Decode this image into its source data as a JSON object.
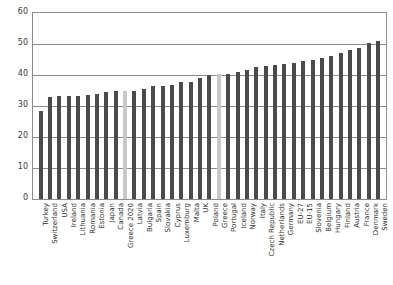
{
  "chart_data": {
    "type": "bar",
    "title": "",
    "subtitle": "",
    "xlabel": "",
    "ylabel": "",
    "ylim": [
      0,
      60
    ],
    "grid": true,
    "legend": "none",
    "y_ticks": [
      0,
      10,
      20,
      30,
      40,
      50,
      60
    ],
    "categories": [
      "Turkey",
      "Switzerland",
      "USA",
      "Ireland",
      "Lithuania",
      "Romania",
      "Estonia",
      "Japan",
      "Canada",
      "Greece 2020",
      "Latvia",
      "Bulgaria",
      "Spain",
      "Slovakia",
      "Cyprus",
      "Luxemburg",
      "Malta",
      "UK",
      "Poland",
      "Greece",
      "Portugal",
      "Iceland",
      "Norway",
      "Italy",
      "Czech Republic",
      "Netherlands",
      "Germany",
      "EU-27",
      "EU-15",
      "Slovenia",
      "Belgium",
      "Hungary",
      "Finland",
      "Austria",
      "France",
      "Denmark",
      "Sweden"
    ],
    "values": [
      28.3,
      32.9,
      33.1,
      33.1,
      33.3,
      33.6,
      33.9,
      34.4,
      34.8,
      35.0,
      35.0,
      35.5,
      36.4,
      36.6,
      36.7,
      37.6,
      37.9,
      39.1,
      40.0,
      40.2,
      40.4,
      41.1,
      41.6,
      42.6,
      43.0,
      43.3,
      43.6,
      44.0,
      44.4,
      44.8,
      45.4,
      46.1,
      47.2,
      48.0,
      48.8,
      50.2,
      51.0
    ],
    "colors": {
      "bar_default": "#4a4a4a",
      "bar_highlight": "#c8c8c8",
      "grid": "#8c8c8c",
      "axis": "#8c8c8c",
      "text": "#2b2b2b",
      "background": "#ffffff"
    },
    "highlighted_categories": [
      "Greece 2020",
      "Greece"
    ]
  }
}
